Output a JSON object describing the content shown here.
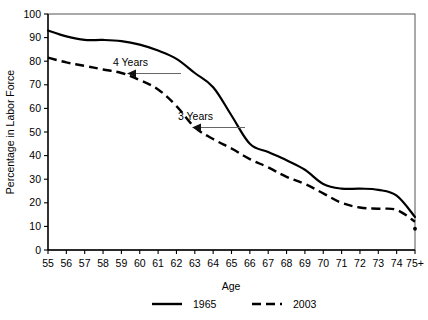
{
  "chart_data": {
    "type": "line",
    "title": "",
    "xlabel": "Age",
    "ylabel": "Percentage in Labor Force",
    "xlim": [
      55,
      75
    ],
    "ylim": [
      0,
      100
    ],
    "grid": false,
    "legend_position": "bottom",
    "x_tick_labels": [
      "55",
      "56",
      "57",
      "58",
      "59",
      "60",
      "61",
      "62",
      "63",
      "64",
      "65",
      "66",
      "67",
      "68",
      "69",
      "70",
      "71",
      "72",
      "73",
      "74",
      "75+"
    ],
    "y_tick_labels": [
      "0",
      "10",
      "20",
      "30",
      "40",
      "50",
      "60",
      "70",
      "80",
      "90",
      "100"
    ],
    "y_ticks": [
      0,
      10,
      20,
      30,
      40,
      50,
      60,
      70,
      80,
      90,
      100
    ],
    "categories": [
      55,
      56,
      57,
      58,
      59,
      60,
      61,
      62,
      63,
      64,
      65,
      66,
      67,
      68,
      69,
      70,
      71,
      72,
      73,
      74,
      75
    ],
    "series": [
      {
        "name": "1965",
        "style": "solid",
        "color": "#000000",
        "values": [
          93,
          90.5,
          89,
          89,
          88.5,
          87,
          84.5,
          81,
          75,
          69,
          57,
          45,
          41.5,
          38,
          34,
          28,
          26,
          26,
          25.5,
          23,
          14
        ]
      },
      {
        "name": "2003",
        "style": "dashed",
        "color": "#000000",
        "values": [
          81.5,
          79.5,
          78,
          76.5,
          75,
          72,
          68,
          61,
          52,
          47,
          43,
          38.5,
          35,
          31,
          28,
          24,
          20,
          18,
          17.5,
          17,
          12
        ]
      }
    ],
    "extra_points": [
      {
        "series": "2003",
        "x": 75,
        "y": 9,
        "marker": "dot"
      }
    ],
    "annotations": [
      {
        "text": "4 Years",
        "target_series": "2003",
        "arrow": "left",
        "label_x": 59.2,
        "label_y": 80.5
      },
      {
        "text": "3 Years",
        "target_series": "2003",
        "arrow": "left",
        "label_x": 63.8,
        "label_y": 56.5
      }
    ]
  },
  "legend": {
    "items": [
      {
        "label": "1965",
        "style": "solid"
      },
      {
        "label": "2003",
        "style": "dashed"
      }
    ]
  }
}
